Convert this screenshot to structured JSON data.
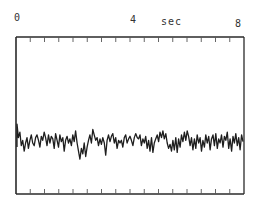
{
  "labels": {
    "t0": "0",
    "t4": "4",
    "unit": "sec",
    "t8": "8"
  },
  "colors": {
    "frame": "#2a2a2a",
    "trace": "#1e1e1e",
    "ticks": "#555555"
  },
  "chart_data": {
    "type": "line",
    "title": "",
    "xlabel": "sec",
    "ylabel": "",
    "xlim": [
      0,
      8
    ],
    "x_tick_labels": [
      "0",
      "4",
      "8"
    ],
    "minor_tick_interval_sec": 0.5,
    "grid": false,
    "legend": "none",
    "series": [
      {
        "name": "signal",
        "description": "noisy oscillating trace, roughly stationary around baseline; amplitude in relative units (0 = baseline, + = up)",
        "x_start": 0,
        "x_end": 8,
        "values": [
          14,
          4,
          8,
          -2,
          2,
          -6,
          0,
          4,
          -4,
          2,
          6,
          0,
          -2,
          4,
          6,
          2,
          -3,
          5,
          2,
          8,
          4,
          -2,
          6,
          0,
          5,
          3,
          -4,
          7,
          2,
          -3,
          6,
          1,
          4,
          -6,
          2,
          5,
          0,
          3,
          -2,
          6,
          1,
          9,
          0,
          -6,
          -12,
          -4,
          -8,
          0,
          -10,
          -3,
          2,
          6,
          0,
          10,
          6,
          2,
          4,
          -2,
          3,
          -1,
          4,
          0,
          -9,
          2,
          6,
          1,
          5,
          7,
          0,
          4,
          -4,
          2,
          0,
          2,
          -3,
          4,
          6,
          0,
          3,
          5,
          2,
          -2,
          4,
          7,
          4,
          3,
          6,
          -2,
          3,
          0,
          5,
          -4,
          2,
          -6,
          4,
          -7,
          0,
          3,
          6,
          1,
          8,
          4,
          9,
          3,
          7,
          0,
          -4,
          -1,
          -6,
          2,
          -5,
          4,
          -7,
          3,
          -3,
          6,
          1,
          8,
          2,
          9,
          5,
          -2,
          4,
          -5,
          3,
          -4,
          6,
          0,
          4,
          -6,
          2,
          -3,
          6,
          0,
          5,
          -5,
          3,
          6,
          -2,
          7,
          -4,
          3,
          0,
          6,
          -3,
          5,
          2,
          8,
          -4,
          3,
          -6,
          5,
          0,
          7,
          -2,
          4,
          -5,
          6,
          1
        ]
      }
    ]
  }
}
